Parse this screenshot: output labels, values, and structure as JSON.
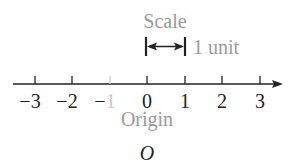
{
  "diagram": {
    "type": "number-line",
    "scale_label": "Scale",
    "unit_label": "1 unit",
    "origin_label": "Origin",
    "origin_symbol": "O",
    "ticks": [
      {
        "value": -3,
        "label": "−3",
        "x": 35,
        "faded": false
      },
      {
        "value": -2,
        "label": "−2",
        "x": 72,
        "faded": false
      },
      {
        "value": -1,
        "label": "−1",
        "x": 110,
        "faded": true
      },
      {
        "value": 0,
        "label": "0",
        "x": 147,
        "faded": false
      },
      {
        "value": 1,
        "label": "1",
        "x": 185,
        "faded": false
      },
      {
        "value": 2,
        "label": "2",
        "x": 222,
        "faded": false
      },
      {
        "value": 3,
        "label": "3",
        "x": 260,
        "faded": false
      }
    ],
    "colors": {
      "line": "#222222",
      "label_grey": "#9a9a9a",
      "faded": "#c8c8c8",
      "text": "#222222"
    }
  }
}
